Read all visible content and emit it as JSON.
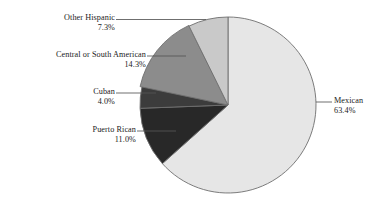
{
  "chart_data": {
    "type": "pie",
    "title": "",
    "xlabel": "",
    "ylabel": "",
    "legend_position": "callout-labels",
    "grid": false,
    "start_angle_deg": 0,
    "direction": "clockwise",
    "categories": [
      "Mexican",
      "Puerto Rican",
      "Cuban",
      "Central or South American",
      "Other Hispanic"
    ],
    "values": [
      63.4,
      11.0,
      4.0,
      14.3,
      7.3
    ],
    "value_labels": [
      "63.4%",
      "11.0%",
      "4.0%",
      "14.3%",
      "7.3%"
    ],
    "units": "percent",
    "colors": [
      "#e6e6e6",
      "#282828",
      "#3c3c3c",
      "#8c8c8c",
      "#c9c9c9"
    ],
    "slices": [
      {
        "name": "Mexican",
        "value": 63.4,
        "value_label": "63.4%",
        "color": "#e6e6e6",
        "start_deg": 0,
        "end_deg": 228.24
      },
      {
        "name": "Puerto Rican",
        "value": 11.0,
        "value_label": "11.0%",
        "color": "#282828",
        "start_deg": 228.24,
        "end_deg": 267.84
      },
      {
        "name": "Cuban",
        "value": 4.0,
        "value_label": "4.0%",
        "color": "#3c3c3c",
        "start_deg": 267.84,
        "end_deg": 282.24
      },
      {
        "name": "Central or South American",
        "value": 14.3,
        "value_label": "14.3%",
        "color": "#8c8c8c",
        "start_deg": 282.24,
        "end_deg": 333.72
      },
      {
        "name": "Other Hispanic",
        "value": 7.3,
        "value_label": "7.3%",
        "color": "#c9c9c9",
        "start_deg": 333.72,
        "end_deg": 360.0
      }
    ]
  },
  "callouts": {
    "other_hispanic": {
      "label": "Other Hispanic",
      "percent": "7.3%"
    },
    "central_south_american": {
      "label": "Central or South American",
      "percent": "14.3%"
    },
    "cuban": {
      "label": "Cuban",
      "percent": "4.0%"
    },
    "puerto_rican": {
      "label": "Puerto Rican",
      "percent": "11.0%"
    },
    "mexican": {
      "label": "Mexican",
      "percent": "63.4%"
    }
  },
  "style": {
    "outline_color": "#6e6e6e",
    "leader_color": "#555555",
    "background": "#ffffff"
  }
}
